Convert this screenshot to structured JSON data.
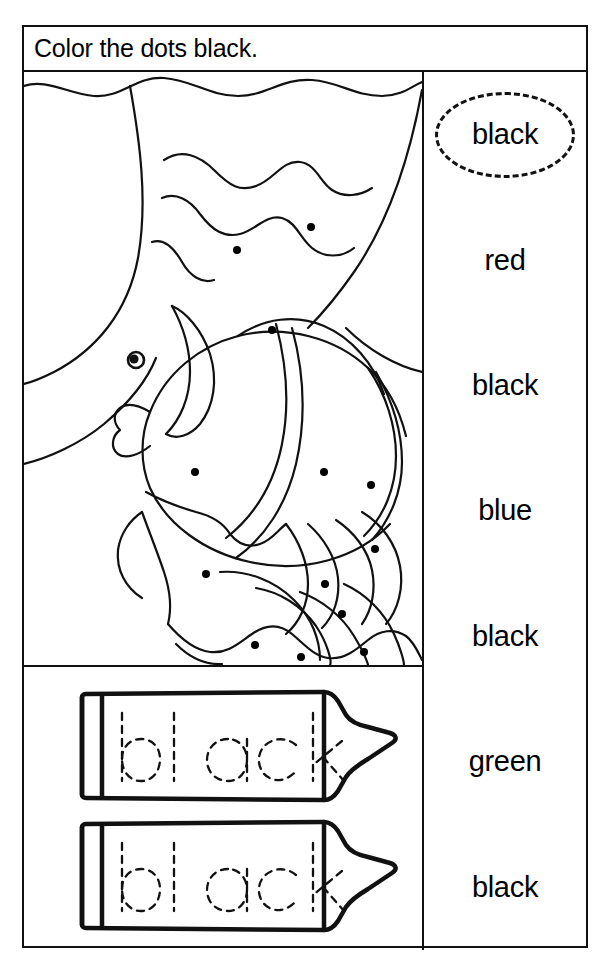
{
  "worksheet": {
    "title": "Color the dots black.",
    "target_color": "black",
    "ink_color": "#111111",
    "paper_color": "#ffffff"
  },
  "picture": {
    "subject": "fish underwater with wavy water lines",
    "dot_color": "#000000",
    "dot_count": 14,
    "dots": [
      {
        "x": 213,
        "y": 178
      },
      {
        "x": 287,
        "y": 155
      },
      {
        "x": 248,
        "y": 258
      },
      {
        "x": 171,
        "y": 400
      },
      {
        "x": 300,
        "y": 400
      },
      {
        "x": 347,
        "y": 413
      },
      {
        "x": 182,
        "y": 502
      },
      {
        "x": 351,
        "y": 477
      },
      {
        "x": 301,
        "y": 512
      },
      {
        "x": 318,
        "y": 542
      },
      {
        "x": 231,
        "y": 573
      },
      {
        "x": 277,
        "y": 585
      },
      {
        "x": 340,
        "y": 580
      },
      {
        "x": 205,
        "y": 625
      }
    ]
  },
  "crayons": [
    {
      "trace_word": "black"
    },
    {
      "trace_word": "black"
    }
  ],
  "word_list": [
    {
      "label": "black",
      "circled": true
    },
    {
      "label": "red",
      "circled": false
    },
    {
      "label": "black",
      "circled": false
    },
    {
      "label": "blue",
      "circled": false
    },
    {
      "label": "black",
      "circled": false
    },
    {
      "label": "green",
      "circled": false
    },
    {
      "label": "black",
      "circled": false
    }
  ]
}
